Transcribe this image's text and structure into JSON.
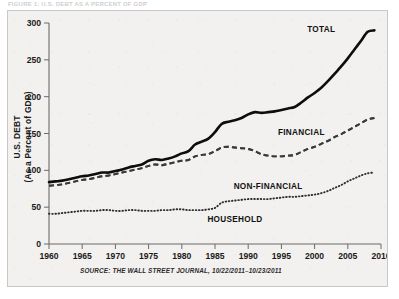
{
  "caption": {
    "text": "FIGURE 1: U.S. DEBT AS A PERCENT OF GDP"
  },
  "chart_data": {
    "type": "line",
    "title": "",
    "xlabel": "",
    "ylabel": "U.S. DEBT",
    "ylabel_line2": "(As a Percent of GDP)",
    "xlim": [
      1960,
      2010
    ],
    "ylim": [
      0,
      300
    ],
    "grid": false,
    "legend_position": "inline-annotations",
    "xticks": [
      1960,
      1965,
      1970,
      1975,
      1980,
      1985,
      1990,
      1995,
      2000,
      2005,
      2010
    ],
    "yticks": [
      0,
      50,
      100,
      150,
      200,
      250,
      300
    ],
    "source": "SOURCE: THE WALL STREET JOURNAL, 10/22/2011–10/23/2011",
    "x": [
      1960,
      1961,
      1962,
      1963,
      1964,
      1965,
      1966,
      1967,
      1968,
      1969,
      1970,
      1971,
      1972,
      1973,
      1974,
      1975,
      1976,
      1977,
      1978,
      1979,
      1980,
      1981,
      1982,
      1983,
      1984,
      1985,
      1986,
      1987,
      1988,
      1989,
      1990,
      1991,
      1992,
      1993,
      1994,
      1995,
      1996,
      1997,
      1998,
      1999,
      2000,
      2001,
      2002,
      2003,
      2004,
      2005,
      2006,
      2007,
      2008,
      2009
    ],
    "series": [
      {
        "name": "TOTAL",
        "style": "solid",
        "label_x": 2001,
        "label_y": 288,
        "values": [
          84,
          85,
          86,
          88,
          90,
          92,
          93,
          95,
          97,
          97,
          99,
          101,
          104,
          106,
          108,
          113,
          115,
          114,
          116,
          119,
          123,
          126,
          135,
          139,
          143,
          152,
          163,
          166,
          168,
          171,
          176,
          179,
          178,
          179,
          180,
          182,
          184,
          186,
          192,
          199,
          205,
          212,
          221,
          231,
          241,
          252,
          264,
          276,
          288,
          290
        ]
      },
      {
        "name": "FINANCIAL",
        "style": "dashed",
        "label_x": 1998,
        "label_y": 148,
        "values": [
          79,
          80,
          81,
          83,
          85,
          87,
          88,
          90,
          92,
          93,
          95,
          97,
          99,
          101,
          103,
          106,
          108,
          107,
          109,
          111,
          113,
          114,
          119,
          121,
          122,
          126,
          131,
          132,
          131,
          130,
          129,
          126,
          122,
          120,
          119,
          119,
          120,
          121,
          125,
          129,
          132,
          136,
          140,
          145,
          149,
          154,
          159,
          164,
          169,
          171
        ]
      },
      {
        "name": "NON-FINANCIAL",
        "style": "dashed-low",
        "label_x": 1993,
        "label_y": 74,
        "values": [
          79,
          80,
          81,
          83,
          85,
          87,
          88,
          90,
          92,
          93,
          95,
          97,
          99,
          101,
          103,
          106,
          108,
          107,
          109,
          111,
          113,
          114,
          119,
          121,
          122,
          126,
          131,
          132,
          131,
          130,
          129,
          126,
          122,
          120,
          119,
          119,
          120,
          121,
          125,
          129,
          132,
          136,
          140,
          145,
          149,
          154,
          159,
          164,
          169,
          171
        ]
      },
      {
        "name": "HOUSEHOLD",
        "style": "dotted",
        "label_x": 1988,
        "label_y": 30,
        "values": [
          41,
          41,
          42,
          43,
          44,
          45,
          45,
          45,
          46,
          46,
          45,
          45,
          46,
          46,
          45,
          45,
          45,
          46,
          46,
          47,
          47,
          46,
          46,
          46,
          47,
          49,
          56,
          58,
          59,
          60,
          61,
          61,
          61,
          61,
          62,
          63,
          64,
          64,
          65,
          66,
          67,
          69,
          72,
          76,
          80,
          85,
          89,
          93,
          96,
          97
        ]
      }
    ]
  }
}
